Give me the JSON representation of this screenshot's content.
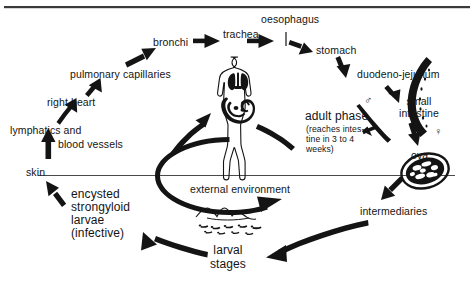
{
  "figure": {
    "top_rule_color": "#3a3a3a",
    "ink_color": "#141414",
    "background": "#ffffff"
  },
  "labels": {
    "bronchi": "bronchi",
    "trachea": "trachea",
    "oesophagus": "oesophagus",
    "stomach": "stomach",
    "duodeno_jejunum": "duodeno-jejunum",
    "small_intestine_line1": "small",
    "small_intestine_line2": "intestine",
    "pulmonary_capillaries": "pulmonary  capillaries",
    "right_heart": "right heart",
    "lymphatics_and": "lymphatics and",
    "blood_vessels": "blood  vessels",
    "skin": "skin",
    "encysted_line1": "encysted",
    "encysted_line2": "strongyloid",
    "encysted_line3": "larvae",
    "encysted_line4": "(infective)",
    "adult_phase": "adult  phase",
    "adult_note_line1": "(reaches  intes-",
    "adult_note_line2": "tine  in  3  to  4",
    "adult_note_line3": "weeks)",
    "ova": "ova",
    "intermediaries": "intermediaries",
    "external_environment": "external environment",
    "larval_line1": "larval",
    "larval_line2": "stages",
    "male_symbol": "♂",
    "female_symbol": "♀"
  },
  "icons": {
    "human_figure": "human-body-figure",
    "lungs": "lungs-organ",
    "intestines": "intestines-organ",
    "male_worm": "male-worm",
    "female_worm": "female-worm",
    "ovum": "ovum-egg",
    "soil": "soil-ground",
    "free_larvae": "free-living-larvae"
  },
  "cycle_steps": [
    "skin",
    "lymphatics and blood vessels",
    "right heart",
    "pulmonary capillaries",
    "bronchi",
    "trachea",
    "oesophagus",
    "stomach",
    "duodeno-jejunum",
    "small intestine",
    "adult phase",
    "ova",
    "intermediaries",
    "larval stages",
    "encysted strongyloid larvae (infective)"
  ]
}
